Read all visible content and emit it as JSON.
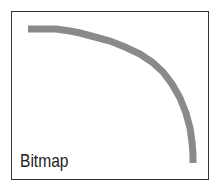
{
  "figure": {
    "label": "Bitmap",
    "stroke_color": "#8a8a8a",
    "border_color": "#333333"
  }
}
